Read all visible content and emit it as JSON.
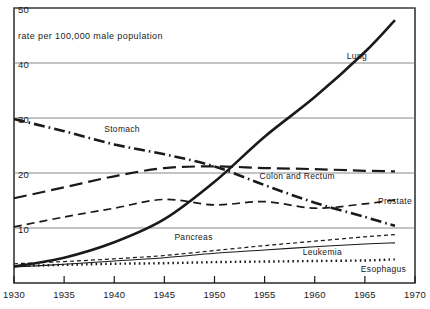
{
  "chart_data": {
    "type": "line",
    "title": "rate per 100,000 male population",
    "xlabel": "",
    "ylabel": "",
    "xlim": [
      1930,
      1970
    ],
    "ylim": [
      0,
      50
    ],
    "grid": true,
    "legend_position": "inline-annotations",
    "xticks": [
      1930,
      1935,
      1940,
      1945,
      1950,
      1955,
      1960,
      1965,
      1970
    ],
    "yticks": [
      10,
      20,
      30,
      40,
      50
    ],
    "x": [
      1930,
      1935,
      1940,
      1945,
      1950,
      1955,
      1960,
      1965,
      1968
    ],
    "series": [
      {
        "name": "Lung",
        "style": "solid-thick",
        "label_x": 1963.2,
        "label_y": 41.2,
        "values": [
          3.0,
          4.6,
          7.4,
          11.6,
          18.4,
          26.6,
          33.8,
          42.0,
          47.8
        ]
      },
      {
        "name": "Stomach",
        "style": "dash-dot",
        "label_x": 1939.0,
        "label_y": 28.0,
        "values": [
          29.8,
          27.6,
          25.2,
          23.4,
          21.2,
          17.8,
          14.6,
          12.0,
          10.4
        ]
      },
      {
        "name": "Colon and Rectum",
        "style": "long-dash",
        "label_x": 1954.5,
        "label_y": 19.4,
        "values": [
          15.4,
          17.4,
          19.4,
          20.9,
          21.2,
          20.9,
          20.7,
          20.4,
          20.3
        ]
      },
      {
        "name": "Prostate",
        "style": "medium-dash",
        "label_x": 1966.3,
        "label_y": 15.0,
        "values": [
          10.2,
          12.0,
          13.6,
          15.2,
          14.2,
          14.8,
          13.6,
          14.4,
          15.1
        ]
      },
      {
        "name": "Pancreas",
        "style": "short-dash",
        "label_x": 1946.0,
        "label_y": 8.4,
        "values": [
          3.5,
          3.9,
          4.4,
          5.0,
          5.9,
          6.8,
          7.6,
          8.4,
          8.8
        ]
      },
      {
        "name": "Leukemia",
        "style": "solid-thin",
        "label_x": 1958.8,
        "label_y": 5.6,
        "values": [
          2.9,
          3.4,
          4.0,
          4.6,
          5.4,
          6.0,
          6.6,
          7.1,
          7.3
        ]
      },
      {
        "name": "Esophagus",
        "style": "dotted",
        "label_x": 1964.6,
        "label_y": 2.6,
        "values": [
          3.1,
          3.3,
          3.5,
          3.6,
          3.8,
          3.9,
          4.0,
          4.1,
          4.3
        ]
      }
    ]
  }
}
